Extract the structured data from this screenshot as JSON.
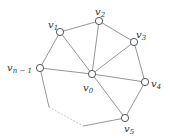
{
  "diagram": {
    "type": "wheel-graph-fragment",
    "nodes": [
      {
        "id": "v0",
        "label": "v",
        "sub": "0",
        "x": 92,
        "y": 74,
        "lx": 83,
        "ly": 91
      },
      {
        "id": "v1",
        "label": "v",
        "sub": "1",
        "x": 60,
        "y": 32,
        "lx": 48,
        "ly": 28
      },
      {
        "id": "v2",
        "label": "v",
        "sub": "2",
        "x": 99,
        "y": 21,
        "lx": 95,
        "ly": 15
      },
      {
        "id": "v3",
        "label": "v",
        "sub": "3",
        "x": 134,
        "y": 42,
        "lx": 136,
        "ly": 38
      },
      {
        "id": "v4",
        "label": "v",
        "sub": "4",
        "x": 145,
        "y": 82,
        "lx": 151,
        "ly": 87
      },
      {
        "id": "v5",
        "label": "v",
        "sub": "5",
        "x": 125,
        "y": 118,
        "lx": 124,
        "ly": 132
      },
      {
        "id": "vn-1",
        "label": "v",
        "sub": "n − 1",
        "x": 40,
        "y": 68,
        "lx": 7,
        "ly": 71
      }
    ],
    "edges": [
      [
        "v1",
        "v2"
      ],
      [
        "v2",
        "v3"
      ],
      [
        "v3",
        "v4"
      ],
      [
        "v4",
        "v5"
      ],
      [
        "vn-1",
        "v1"
      ],
      [
        "v0",
        "v1"
      ],
      [
        "v0",
        "v2"
      ],
      [
        "v0",
        "v3"
      ],
      [
        "v0",
        "v4"
      ],
      [
        "v0",
        "v5"
      ],
      [
        "v0",
        "vn-1"
      ]
    ],
    "open_path": {
      "solid_1": [
        [
          40,
          68
        ],
        [
          49,
          107
        ]
      ],
      "dotted": [
        [
          49,
          107
        ],
        [
          83,
          126
        ]
      ],
      "solid_2": [
        [
          83,
          126
        ],
        [
          125,
          118
        ]
      ]
    }
  }
}
